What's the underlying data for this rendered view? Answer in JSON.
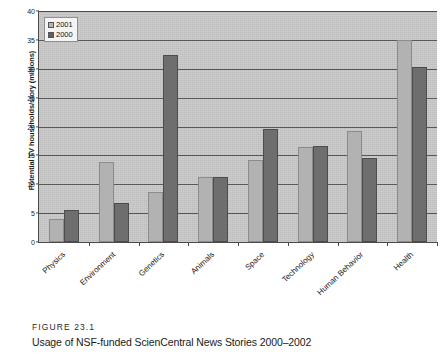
{
  "figure": {
    "id_label": "FIGURE 23.1",
    "caption": "Usage of NSF-funded ScienCentral News Stories 2000–2002"
  },
  "legend": {
    "items": [
      {
        "label": "2001",
        "color": "#b2b2b2"
      },
      {
        "label": "2000",
        "color": "#5f5f5f"
      }
    ]
  },
  "chart_data": {
    "type": "bar",
    "title": "",
    "xlabel": "",
    "ylabel": "Potential TV households/story (millions)",
    "ylim": [
      0,
      40
    ],
    "yticks": [
      0,
      5,
      10,
      15,
      20,
      25,
      30,
      35,
      40
    ],
    "ytick_labels": [
      "0",
      "5",
      "10",
      "15",
      "20",
      "25",
      "30",
      "35",
      "40"
    ],
    "grid": true,
    "legend_position": "top-left",
    "categories": [
      "Physics",
      "Environment",
      "Genetics",
      "Animals",
      "Space",
      "Technology",
      "Human Behavior",
      "Health"
    ],
    "series": [
      {
        "name": "2001",
        "color": "#b2b2b2",
        "values": [
          4.0,
          13.8,
          8.7,
          11.3,
          14.2,
          16.5,
          19.2,
          35.0
        ]
      },
      {
        "name": "2000",
        "color": "#5f5f5f",
        "values": [
          5.6,
          6.8,
          32.3,
          11.2,
          19.5,
          16.6,
          14.6,
          30.3
        ]
      }
    ]
  }
}
